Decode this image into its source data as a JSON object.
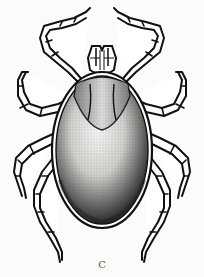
{
  "figure": {
    "caption": "C",
    "colors": {
      "background": "#fbfbfa",
      "ink": "#111111",
      "stipple": "#333333",
      "caption": "#555555"
    }
  }
}
